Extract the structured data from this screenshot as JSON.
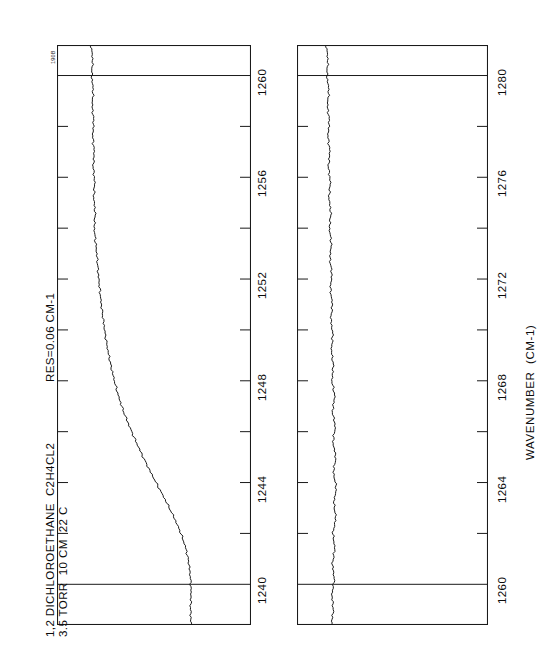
{
  "figure": {
    "corner_code": "190B",
    "orientation": "rotated-90",
    "sample_lines": [
      "1,2 DICHLOROETHANE  C2H4CL2",
      "3.5 TORR  10 CM  22 C"
    ],
    "resolution_label": "RES=0.06 CM-1",
    "axis_title": "WAVENUMBER  (CM-1)",
    "line_color": "#1a1a1a",
    "frame_color": "#1a1a1a",
    "background_color": "#ffffff"
  },
  "chart_data": [
    {
      "id": "panel-lower-range",
      "type": "line",
      "title": "1,2 DICHLOROETHANE  C2H4CL2",
      "subtitle": "3.5 TORR  10 CM  22 C",
      "annotation": "RES=0.06 CM-1",
      "xlabel": "WAVENUMBER  (CM-1)",
      "ylabel": "TRANSMITTANCE",
      "xlim": [
        1238.4,
        1261.2
      ],
      "ylim": [
        0.0,
        1.0
      ],
      "grid": false,
      "major_ticks": [
        1260,
        1256,
        1252,
        1248,
        1244,
        1240
      ],
      "minor_ticks": [
        1258,
        1254,
        1250,
        1246,
        1242
      ],
      "major_gridlines": [
        1260,
        1240
      ],
      "tick_labels": [
        "1260",
        "1256",
        "1252",
        "1248",
        "1244",
        "1240"
      ],
      "x": [
        1261.2,
        1260.6,
        1260.0,
        1259.4,
        1258.8,
        1258.2,
        1257.6,
        1257.0,
        1256.4,
        1255.8,
        1255.2,
        1254.6,
        1254.0,
        1253.4,
        1252.8,
        1252.2,
        1251.6,
        1251.0,
        1250.4,
        1249.8,
        1249.2,
        1248.6,
        1248.0,
        1247.4,
        1246.8,
        1246.2,
        1245.6,
        1245.0,
        1244.4,
        1243.8,
        1243.2,
        1242.6,
        1242.0,
        1241.4,
        1240.8,
        1240.2,
        1239.6,
        1239.0,
        1238.4
      ],
      "y": [
        0.96,
        0.957,
        0.959,
        0.956,
        0.958,
        0.955,
        0.957,
        0.954,
        0.956,
        0.953,
        0.955,
        0.952,
        0.954,
        0.951,
        0.948,
        0.946,
        0.943,
        0.94,
        0.936,
        0.932,
        0.927,
        0.921,
        0.914,
        0.906,
        0.896,
        0.884,
        0.871,
        0.857,
        0.842,
        0.826,
        0.81,
        0.795,
        0.782,
        0.772,
        0.766,
        0.763,
        0.762,
        0.763,
        0.762
      ]
    },
    {
      "id": "panel-upper-range",
      "type": "line",
      "xlabel": "WAVENUMBER  (CM-1)",
      "ylabel": "TRANSMITTANCE",
      "xlim": [
        1258.4,
        1281.2
      ],
      "ylim": [
        0.0,
        1.0
      ],
      "grid": false,
      "major_ticks": [
        1280,
        1276,
        1272,
        1268,
        1264,
        1260
      ],
      "minor_ticks": [
        1278,
        1274,
        1270,
        1266,
        1262
      ],
      "major_gridlines": [
        1280,
        1260
      ],
      "tick_labels": [
        "1280",
        "1276",
        "1272",
        "1268",
        "1264",
        "1260"
      ],
      "x": [
        1281.2,
        1280.6,
        1280.0,
        1279.4,
        1278.8,
        1278.2,
        1277.6,
        1277.0,
        1276.4,
        1275.8,
        1275.2,
        1274.6,
        1274.0,
        1273.4,
        1272.8,
        1272.2,
        1271.6,
        1271.0,
        1270.4,
        1269.8,
        1269.2,
        1268.6,
        1268.0,
        1267.4,
        1266.8,
        1266.2,
        1265.6,
        1265.0,
        1264.4,
        1263.8,
        1263.2,
        1262.6,
        1262.0,
        1261.4,
        1260.8,
        1260.2,
        1259.6,
        1259.0,
        1258.4
      ],
      "y": [
        0.969,
        0.966,
        0.968,
        0.964,
        0.967,
        0.963,
        0.966,
        0.962,
        0.965,
        0.961,
        0.964,
        0.96,
        0.963,
        0.959,
        0.962,
        0.958,
        0.961,
        0.957,
        0.96,
        0.956,
        0.959,
        0.955,
        0.958,
        0.952,
        0.957,
        0.951,
        0.956,
        0.95,
        0.955,
        0.949,
        0.954,
        0.95,
        0.956,
        0.952,
        0.957,
        0.953,
        0.958,
        0.955,
        0.959
      ]
    }
  ]
}
